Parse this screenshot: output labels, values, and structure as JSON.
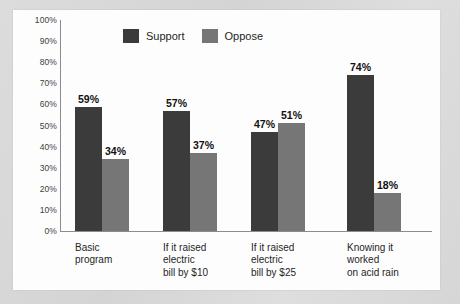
{
  "chart_data": {
    "type": "bar",
    "title": "",
    "subtitle": "",
    "xlabel": "",
    "ylabel": "",
    "ylim": [
      0,
      100
    ],
    "grid": false,
    "legend_position": "top-center",
    "value_suffix": "%",
    "categories": [
      "Basic\nprogram",
      "If it raised\nelectric\nbill by $10",
      "If it raised\nelectric\nbill by $25",
      "Knowing it\nworked\non acid rain"
    ],
    "category_lines": [
      [
        "Basic",
        "program"
      ],
      [
        "If it raised",
        "electric",
        "bill by $10"
      ],
      [
        "If it raised",
        "electric",
        "bill by $25"
      ],
      [
        "Knowing it",
        "worked",
        "on acid rain"
      ]
    ],
    "series": [
      {
        "name": "Support",
        "color": "#3b3b3b",
        "values": [
          59,
          57,
          47,
          74
        ]
      },
      {
        "name": "Oppose",
        "color": "#767676",
        "values": [
          34,
          37,
          51,
          18
        ]
      }
    ],
    "y_ticks": [
      "0%",
      "10%",
      "20%",
      "30%",
      "40%",
      "50%",
      "60%",
      "70%",
      "80%",
      "90%",
      "100%"
    ],
    "y_tick_values": [
      0,
      10,
      20,
      30,
      40,
      50,
      60,
      70,
      80,
      90,
      100
    ],
    "data_labels": [
      [
        "59%",
        "34%"
      ],
      [
        "57%",
        "37%"
      ],
      [
        "47%",
        "51%"
      ],
      [
        "74%",
        "18%"
      ]
    ]
  },
  "legend": {
    "items": [
      {
        "label": "Support",
        "color": "#3b3b3b"
      },
      {
        "label": "Oppose",
        "color": "#767676"
      }
    ]
  },
  "colors": {
    "support": "#3b3b3b",
    "oppose": "#767676",
    "axis": "#8c8c8c",
    "card_background": "#fdfdfd",
    "page_background": "#d9d9d9",
    "text": "#1f1f1f"
  }
}
